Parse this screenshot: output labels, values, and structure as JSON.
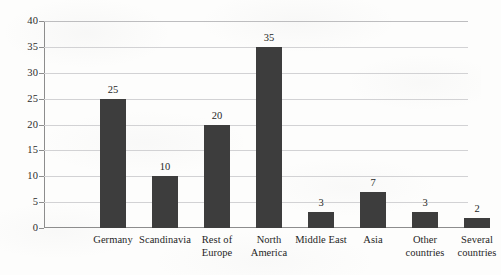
{
  "chart_data": {
    "type": "bar",
    "title": "",
    "subtitle": "",
    "xlabel": "",
    "ylabel": "",
    "categories": [
      "Germany",
      "Scandinavia",
      "Rest of Europe",
      "North America",
      "Middle East",
      "Asia",
      "Other countries",
      "Several countries"
    ],
    "category_lines": [
      [
        "Germany"
      ],
      [
        "Scandinavia"
      ],
      [
        "Rest of",
        "Europe"
      ],
      [
        "North",
        "America"
      ],
      [
        "Middle East"
      ],
      [
        "Asia"
      ],
      [
        "Other",
        "countries"
      ],
      [
        "Several",
        "countries"
      ]
    ],
    "values": [
      25,
      10,
      20,
      35,
      3,
      7,
      3,
      2
    ],
    "value_labels": [
      "25",
      "10",
      "20",
      "35",
      "3",
      "7",
      "3",
      "2"
    ],
    "ylim": [
      0,
      40
    ],
    "ytick_step": 5,
    "yticks": [
      0,
      5,
      10,
      15,
      20,
      25,
      30,
      35,
      40
    ],
    "ytick_labels": [
      "0",
      "5",
      "10",
      "15",
      "20",
      "25",
      "30",
      "35",
      "40"
    ],
    "grid": true,
    "grid_axis": "y",
    "legend": false,
    "legend_position": "none",
    "data_labels": true,
    "bar_color": "#3d3d3d",
    "gridline_color": "#d2d2d4",
    "axis_color": "#8d8d8d",
    "background_color": "#fdfdfc",
    "text_color": "#1f1f1f"
  }
}
